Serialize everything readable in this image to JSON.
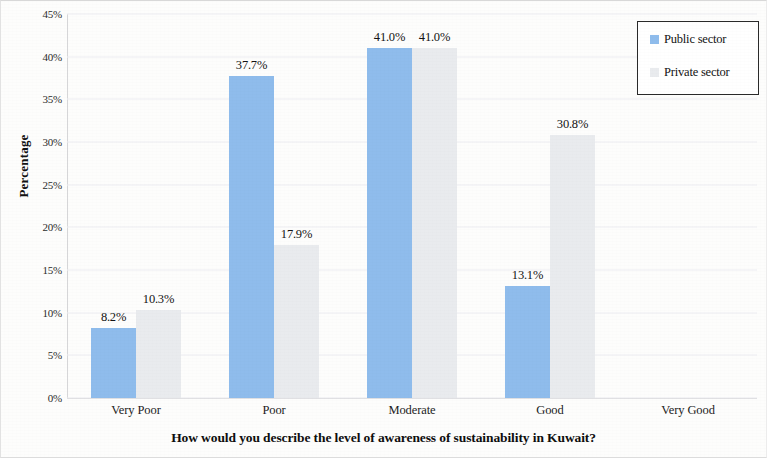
{
  "chart_data": {
    "type": "bar",
    "title": "",
    "xlabel": "How would you describe the level of awareness of sustainability in Kuwait?",
    "ylabel": "Percentage",
    "categories": [
      "Very Poor",
      "Poor",
      "Moderate",
      "Good",
      "Very Good"
    ],
    "series": [
      {
        "name": "Public sector",
        "color": "#8fbcec",
        "values": [
          8.2,
          37.7,
          41.0,
          13.1,
          0
        ],
        "labels": [
          "8.2%",
          "37.7%",
          "41.0%",
          "13.1%",
          ""
        ]
      },
      {
        "name": "Private sector",
        "color": "#e9ebee",
        "values": [
          10.3,
          17.9,
          41.0,
          30.8,
          0
        ],
        "labels": [
          "10.3%",
          "17.9%",
          "41.0%",
          "30.8%",
          ""
        ]
      }
    ],
    "ylim": [
      0,
      45
    ],
    "ytick_values": [
      0,
      5,
      10,
      15,
      20,
      25,
      30,
      35,
      40,
      45
    ],
    "ytick_labels": [
      "0%",
      "5%",
      "10%",
      "15%",
      "20%",
      "25%",
      "30%",
      "35%",
      "40%",
      "45%"
    ],
    "grid": true,
    "legend_position": "top-right"
  },
  "legend": {
    "entries": [
      {
        "label": "Public sector",
        "color": "#8fbcec"
      },
      {
        "label": "Private sector",
        "color": "#e9ebee"
      }
    ]
  }
}
